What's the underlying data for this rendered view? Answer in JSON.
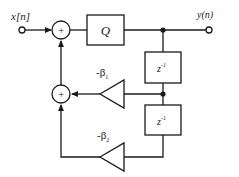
{
  "diagram": {
    "type": "signal-flow block diagram",
    "input_label": "x[n]",
    "output_label": "y(n)",
    "quantizer_label": "Q",
    "delay_1_label": "z",
    "delay_1_exp": "-1",
    "delay_2_label": "z",
    "delay_2_exp": "-1",
    "gain_1_label": "-β",
    "gain_1_sub": "1",
    "gain_2_label": "-β",
    "gain_2_sub": "2",
    "adder_symbol": "+",
    "stroke_color": "#1a1a1a",
    "background": "#ffffff"
  }
}
